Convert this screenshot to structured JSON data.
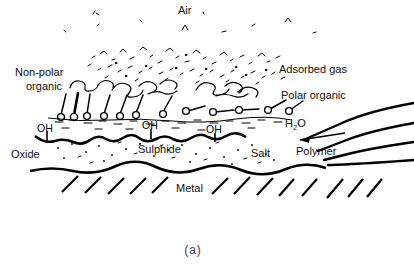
{
  "figure": {
    "caption": "(a)",
    "title_region": "Schematic cross-section of a real metal surface",
    "background_color": "#ffffff",
    "ink_color": "#000000"
  },
  "labels": {
    "air": "Air",
    "adsorbed_gas": "Adsorbed gas",
    "non_polar_organic": "Non-polar\norganic",
    "non_polar_organic_line1": "Non-polar",
    "non_polar_organic_line2": "organic",
    "polar_organic": "Polar organic",
    "water": "H",
    "water_sub": "2",
    "water_tail": "O",
    "water_full": "H2O",
    "hydroxyl": "OH",
    "oxide": "Oxide",
    "sulphide": "Sulphide",
    "salt": "Salt",
    "polymer": "Polymer",
    "metal": "Metal"
  },
  "hydroxyl_sites": [
    {
      "id": "oh-1",
      "label": "OH",
      "x": 44,
      "y": 130
    },
    {
      "id": "oh-2",
      "label": "OH",
      "x": 148,
      "y": 127
    },
    {
      "id": "oh-3",
      "label": "OH",
      "x": 212,
      "y": 131
    }
  ],
  "layers": [
    {
      "name": "air",
      "label": "Air",
      "order": 1
    },
    {
      "name": "adsorbed-gas",
      "label": "Adsorbed gas",
      "order": 2
    },
    {
      "name": "organic",
      "label": "Non-polar organic / Polar organic",
      "order": 3
    },
    {
      "name": "water",
      "label": "H2O",
      "order": 4
    },
    {
      "name": "hydroxyl",
      "label": "OH",
      "order": 5
    },
    {
      "name": "oxide",
      "label": "Oxide / Sulphide / Salt",
      "order": 6
    },
    {
      "name": "metal",
      "label": "Metal",
      "order": 7
    }
  ],
  "molecules": {
    "upright_count": 7,
    "flat_count": 5,
    "description": "amphiphile lollipop glyphs: circular polar head on surface, straight tail upward"
  },
  "polymer": {
    "curve_count": 4,
    "arrow": "left-pointing arrow from polymer region to surface"
  },
  "metal_hatch_count": 13
}
